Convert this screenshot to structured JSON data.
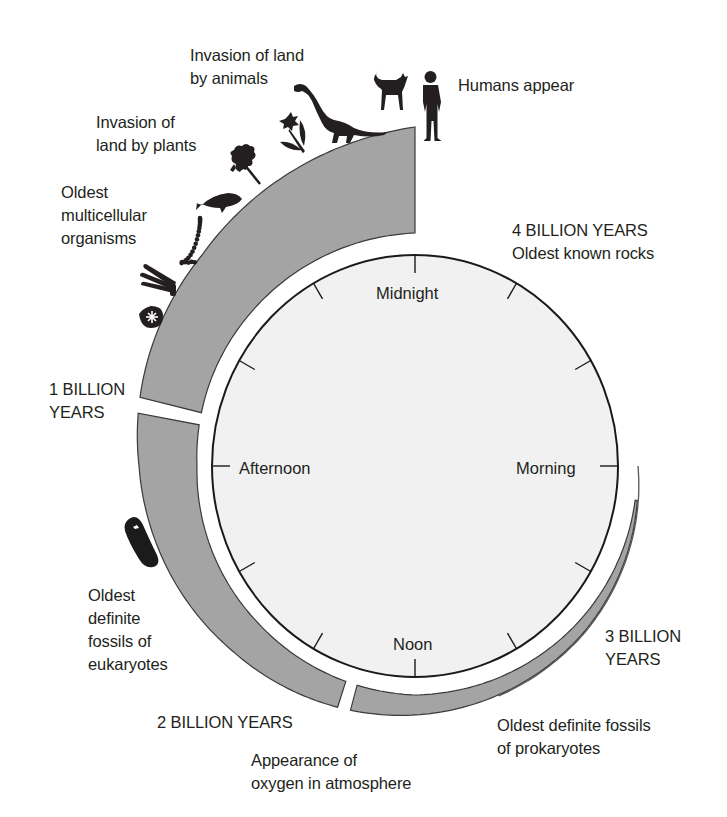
{
  "figure": {
    "colors": {
      "band": "#a4a4a4",
      "band_stroke": "#3a3a3a",
      "clock_face": "#f1f1f1",
      "clock_stroke": "#1a1a1a",
      "icon": "#231f20",
      "text": "#231f20"
    },
    "geometry": {
      "center": [
        415,
        466
      ],
      "clock_rx": 203,
      "clock_ry": 211,
      "outer_radius_stops": [
        [
          0,
          339
        ],
        [
          45,
          300
        ],
        [
          90,
          276
        ],
        [
          135,
          260
        ],
        [
          180,
          249
        ],
        [
          225,
          237
        ],
        [
          270,
          222
        ]
      ],
      "inner_radius_stops": [
        [
          0,
          233
        ],
        [
          45,
          225
        ],
        [
          90,
          218
        ],
        [
          135,
          222
        ],
        [
          180,
          229
        ],
        [
          225,
          226
        ],
        [
          270,
          222
        ]
      ],
      "splits_deg_ccw_from_top": [
        78,
        164
      ]
    }
  },
  "clock": {
    "labels": {
      "top": "Midnight",
      "left": "Afternoon",
      "right": "Morning",
      "bottom": "Noon"
    },
    "tick_count": 12
  },
  "annotations": {
    "humans": "Humans appear",
    "animals_line1": "Invasion of land",
    "animals_line2": "by animals",
    "plants_line1": "Invasion of",
    "plants_line2": "land by plants",
    "multicellular_line1": "Oldest",
    "multicellular_line2": "multicellular",
    "multicellular_line3": "organisms",
    "four_billion_line1": "4 BILLION YEARS",
    "four_billion_line2": "Oldest known rocks",
    "one_billion_line1": "1 BILLION",
    "one_billion_line2": "YEARS",
    "eukaryotes_line1": "Oldest",
    "eukaryotes_line2": "definite",
    "eukaryotes_line3": "fossils of",
    "eukaryotes_line4": "eukaryotes",
    "two_billion": "2 BILLION YEARS",
    "oxygen_line1": "Appearance of",
    "oxygen_line2": "oxygen in atmosphere",
    "three_billion_line1": "3 BILLION",
    "three_billion_line2": "YEARS",
    "prokaryotes_line1": "Oldest definite fossils",
    "prokaryotes_line2": "of prokaryotes"
  },
  "icons": [
    {
      "name": "human-icon",
      "meaning": "Humans"
    },
    {
      "name": "dog-icon",
      "meaning": "Mammals"
    },
    {
      "name": "dinosaur-icon",
      "meaning": "Dinosaurs"
    },
    {
      "name": "flower-icon",
      "meaning": "Flowering plants"
    },
    {
      "name": "moss-plant-icon",
      "meaning": "Early land plants"
    },
    {
      "name": "fish-icon",
      "meaning": "Fish"
    },
    {
      "name": "chain-organism-icon",
      "meaning": "Filamentous algae"
    },
    {
      "name": "sponge-icon",
      "meaning": "Early multicellular organisms"
    },
    {
      "name": "cell-icon",
      "meaning": "Single cell"
    },
    {
      "name": "eukaryote-cell-icon",
      "meaning": "Eukaryote fossil"
    }
  ]
}
